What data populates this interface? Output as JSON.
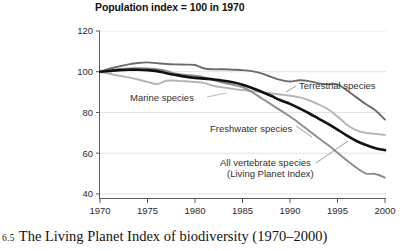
{
  "figure": {
    "caption_number": "6.5",
    "caption_text": "The Living Planet Index of biodiversity (1970–2000)"
  },
  "chart_data": {
    "type": "line",
    "title": "Population index = 100 in 1970",
    "subtitle": "",
    "xlabel": "",
    "ylabel": "",
    "xlim": [
      1970,
      2000
    ],
    "ylim": [
      37.5,
      120
    ],
    "grid": true,
    "grid_axis": "y",
    "legend": "inline-annotations",
    "xticks": [
      1970,
      1975,
      1980,
      1985,
      1990,
      1995,
      2000
    ],
    "xtick_labels": [
      "1970",
      "1975",
      "1980",
      "1985",
      "1990",
      "1995",
      "2000"
    ],
    "yticks": [
      40,
      60,
      80,
      100,
      120
    ],
    "ytick_labels": [
      "40",
      "60",
      "80",
      "100",
      "120"
    ],
    "x": [
      1970,
      1971,
      1972,
      1973,
      1974,
      1975,
      1976,
      1977,
      1978,
      1979,
      1980,
      1981,
      1982,
      1983,
      1984,
      1985,
      1986,
      1987,
      1988,
      1989,
      1990,
      1991,
      1992,
      1993,
      1994,
      1995,
      1996,
      1997,
      1998,
      1999,
      2000
    ],
    "series": [
      {
        "name": "Terrestrial species",
        "color": "#6b6b6b",
        "width": 1.9,
        "label_x": 1992.5,
        "label_y": 93.5,
        "values": [
          100,
          101.5,
          102.6,
          103.6,
          104.3,
          104.6,
          104.2,
          103.8,
          103.6,
          103.5,
          103.3,
          101.6,
          101.2,
          101.2,
          101.0,
          100.8,
          100.3,
          99.2,
          97.5,
          96.0,
          95.2,
          95.8,
          95.4,
          94.3,
          93.9,
          93.8,
          90.8,
          87.4,
          84.0,
          81.0,
          76.5
        ]
      },
      {
        "name": "Marine species",
        "color": "#b4b4b4",
        "width": 1.9,
        "label_x": 1978.0,
        "label_y": 88.5,
        "values": [
          100,
          99.0,
          98.0,
          97.2,
          96.2,
          95.0,
          94.0,
          95.6,
          95.6,
          95.3,
          95.0,
          94.4,
          93.0,
          92.3,
          91.6,
          91.0,
          90.5,
          90.0,
          89.4,
          88.8,
          88.2,
          87.4,
          86.0,
          84.0,
          81.6,
          78.0,
          74.0,
          71.2,
          70.0,
          69.5,
          69.0
        ]
      },
      {
        "name": "Freshwater species",
        "color": "#8c8c8c",
        "width": 1.9,
        "label_x": 1983.0,
        "label_y": 72.0,
        "values": [
          100,
          100.6,
          101.2,
          101.6,
          101.7,
          101.6,
          101.2,
          100.4,
          99.0,
          98.4,
          98.0,
          97.2,
          95.8,
          94.6,
          93.6,
          92.4,
          90.0,
          87.0,
          84.0,
          81.0,
          78.0,
          74.6,
          71.0,
          67.4,
          64.0,
          60.2,
          56.4,
          52.8,
          50.0,
          49.8,
          48.0
        ]
      },
      {
        "name": "All vertebrate species (Living Planet Index)",
        "color": "#111111",
        "width": 2.6,
        "label_x": 1983.5,
        "label_y": 57.0,
        "values": [
          100,
          100.4,
          100.8,
          101.0,
          101.0,
          100.8,
          100.3,
          99.3,
          98.4,
          97.6,
          97.0,
          96.6,
          96.2,
          95.6,
          94.8,
          93.6,
          92.0,
          90.2,
          88.2,
          86.0,
          84.2,
          82.0,
          79.6,
          77.0,
          74.4,
          71.6,
          68.6,
          66.0,
          64.0,
          62.4,
          61.5
        ]
      }
    ],
    "annotations": [
      {
        "name": "terrestrial-label",
        "text": "Terrestrial species"
      },
      {
        "name": "marine-label",
        "text": "Marine species"
      },
      {
        "name": "freshwater-label",
        "text": "Freshwater species"
      },
      {
        "name": "lpi-label-line1",
        "text": "All vertebrate species"
      },
      {
        "name": "lpi-label-line2",
        "text": "(Living Planet Index)"
      }
    ]
  }
}
